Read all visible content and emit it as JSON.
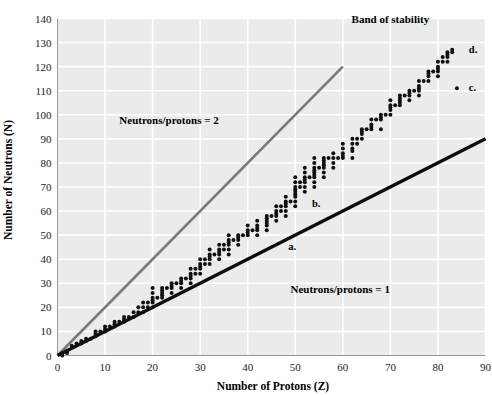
{
  "chart_data": {
    "type": "scatter",
    "title": "",
    "xlabel": "Number of Protons (Z)",
    "ylabel": "Number of Neutrons (N)",
    "xlim": [
      0,
      90
    ],
    "ylim": [
      0,
      140
    ],
    "xticks": [
      0,
      10,
      20,
      30,
      40,
      50,
      60,
      70,
      80,
      90
    ],
    "yticks": [
      0,
      10,
      20,
      30,
      40,
      50,
      60,
      70,
      80,
      90,
      100,
      110,
      120,
      130,
      140
    ],
    "xtick_labels": [
      "0",
      "10",
      "20",
      "30",
      "40",
      "50",
      "60",
      "70",
      "80",
      "90"
    ],
    "ytick_labels": [
      "0",
      "10",
      "20",
      "30",
      "40",
      "50",
      "60",
      "70",
      "80",
      "90",
      "100",
      "110",
      "120",
      "130",
      "140"
    ],
    "grid": true,
    "grid_color": "#ffffff",
    "plot_background": "#ebebeb",
    "legend": "none",
    "series": [
      {
        "name": "Stable nuclides",
        "type": "scatter",
        "marker": "circle",
        "color": "#111111",
        "points": [
          [
            1,
            0
          ],
          [
            1,
            1
          ],
          [
            2,
            1
          ],
          [
            2,
            2
          ],
          [
            3,
            4
          ],
          [
            4,
            5
          ],
          [
            5,
            5
          ],
          [
            5,
            6
          ],
          [
            6,
            6
          ],
          [
            6,
            7
          ],
          [
            7,
            7
          ],
          [
            8,
            8
          ],
          [
            8,
            9
          ],
          [
            8,
            10
          ],
          [
            9,
            10
          ],
          [
            10,
            10
          ],
          [
            10,
            11
          ],
          [
            10,
            12
          ],
          [
            11,
            12
          ],
          [
            12,
            12
          ],
          [
            12,
            13
          ],
          [
            12,
            14
          ],
          [
            13,
            14
          ],
          [
            14,
            14
          ],
          [
            14,
            15
          ],
          [
            14,
            16
          ],
          [
            15,
            16
          ],
          [
            16,
            16
          ],
          [
            16,
            18
          ],
          [
            17,
            18
          ],
          [
            17,
            20
          ],
          [
            18,
            18
          ],
          [
            18,
            20
          ],
          [
            18,
            22
          ],
          [
            19,
            20
          ],
          [
            19,
            22
          ],
          [
            20,
            20
          ],
          [
            20,
            22
          ],
          [
            20,
            23
          ],
          [
            20,
            24
          ],
          [
            20,
            26
          ],
          [
            20,
            28
          ],
          [
            21,
            24
          ],
          [
            22,
            24
          ],
          [
            22,
            25
          ],
          [
            22,
            26
          ],
          [
            22,
            27
          ],
          [
            22,
            28
          ],
          [
            23,
            28
          ],
          [
            24,
            26
          ],
          [
            24,
            28
          ],
          [
            24,
            29
          ],
          [
            24,
            30
          ],
          [
            25,
            30
          ],
          [
            26,
            28
          ],
          [
            26,
            30
          ],
          [
            26,
            31
          ],
          [
            26,
            32
          ],
          [
            27,
            32
          ],
          [
            28,
            30
          ],
          [
            28,
            32
          ],
          [
            28,
            33
          ],
          [
            28,
            34
          ],
          [
            28,
            36
          ],
          [
            29,
            34
          ],
          [
            29,
            36
          ],
          [
            30,
            34
          ],
          [
            30,
            36
          ],
          [
            30,
            37
          ],
          [
            30,
            38
          ],
          [
            30,
            40
          ],
          [
            31,
            38
          ],
          [
            31,
            40
          ],
          [
            32,
            38
          ],
          [
            32,
            40
          ],
          [
            32,
            41
          ],
          [
            32,
            42
          ],
          [
            32,
            44
          ],
          [
            33,
            42
          ],
          [
            34,
            40
          ],
          [
            34,
            42
          ],
          [
            34,
            43
          ],
          [
            34,
            44
          ],
          [
            34,
            46
          ],
          [
            35,
            44
          ],
          [
            35,
            46
          ],
          [
            36,
            42
          ],
          [
            36,
            44
          ],
          [
            36,
            46
          ],
          [
            36,
            47
          ],
          [
            36,
            48
          ],
          [
            36,
            50
          ],
          [
            37,
            48
          ],
          [
            38,
            46
          ],
          [
            38,
            48
          ],
          [
            38,
            49
          ],
          [
            38,
            50
          ],
          [
            39,
            50
          ],
          [
            40,
            50
          ],
          [
            40,
            51
          ],
          [
            40,
            52
          ],
          [
            40,
            54
          ],
          [
            41,
            52
          ],
          [
            42,
            50
          ],
          [
            42,
            52
          ],
          [
            42,
            53
          ],
          [
            42,
            54
          ],
          [
            42,
            56
          ],
          [
            44,
            52
          ],
          [
            44,
            54
          ],
          [
            44,
            55
          ],
          [
            44,
            56
          ],
          [
            44,
            57
          ],
          [
            44,
            58
          ],
          [
            45,
            58
          ],
          [
            46,
            56
          ],
          [
            46,
            58
          ],
          [
            46,
            59
          ],
          [
            46,
            60
          ],
          [
            46,
            62
          ],
          [
            47,
            60
          ],
          [
            47,
            62
          ],
          [
            48,
            58
          ],
          [
            48,
            60
          ],
          [
            48,
            62
          ],
          [
            48,
            63
          ],
          [
            48,
            64
          ],
          [
            48,
            66
          ],
          [
            49,
            64
          ],
          [
            50,
            62
          ],
          [
            50,
            64
          ],
          [
            50,
            66
          ],
          [
            50,
            67
          ],
          [
            50,
            68
          ],
          [
            50,
            69
          ],
          [
            50,
            70
          ],
          [
            50,
            72
          ],
          [
            50,
            74
          ],
          [
            51,
            70
          ],
          [
            51,
            72
          ],
          [
            52,
            68
          ],
          [
            52,
            70
          ],
          [
            52,
            72
          ],
          [
            52,
            73
          ],
          [
            52,
            74
          ],
          [
            52,
            76
          ],
          [
            52,
            78
          ],
          [
            53,
            74
          ],
          [
            54,
            70
          ],
          [
            54,
            72
          ],
          [
            54,
            74
          ],
          [
            54,
            75
          ],
          [
            54,
            76
          ],
          [
            54,
            77
          ],
          [
            54,
            78
          ],
          [
            54,
            80
          ],
          [
            54,
            82
          ],
          [
            55,
            78
          ],
          [
            56,
            74
          ],
          [
            56,
            76
          ],
          [
            56,
            78
          ],
          [
            56,
            79
          ],
          [
            56,
            80
          ],
          [
            56,
            81
          ],
          [
            56,
            82
          ],
          [
            57,
            82
          ],
          [
            58,
            78
          ],
          [
            58,
            80
          ],
          [
            58,
            82
          ],
          [
            58,
            84
          ],
          [
            59,
            82
          ],
          [
            60,
            82
          ],
          [
            60,
            83
          ],
          [
            60,
            84
          ],
          [
            60,
            86
          ],
          [
            60,
            88
          ],
          [
            62,
            82
          ],
          [
            62,
            85
          ],
          [
            62,
            86
          ],
          [
            62,
            88
          ],
          [
            62,
            90
          ],
          [
            63,
            88
          ],
          [
            63,
            90
          ],
          [
            64,
            90
          ],
          [
            64,
            92
          ],
          [
            64,
            93
          ],
          [
            64,
            94
          ],
          [
            65,
            94
          ],
          [
            66,
            94
          ],
          [
            66,
            95
          ],
          [
            66,
            96
          ],
          [
            66,
            98
          ],
          [
            67,
            98
          ],
          [
            68,
            94
          ],
          [
            68,
            98
          ],
          [
            68,
            99
          ],
          [
            68,
            100
          ],
          [
            69,
            100
          ],
          [
            70,
            100
          ],
          [
            70,
            102
          ],
          [
            70,
            103
          ],
          [
            70,
            104
          ],
          [
            70,
            106
          ],
          [
            71,
            104
          ],
          [
            72,
            104
          ],
          [
            72,
            105
          ],
          [
            72,
            106
          ],
          [
            72,
            107
          ],
          [
            72,
            108
          ],
          [
            73,
            108
          ],
          [
            74,
            106
          ],
          [
            74,
            108
          ],
          [
            74,
            109
          ],
          [
            74,
            110
          ],
          [
            75,
            110
          ],
          [
            76,
            108
          ],
          [
            76,
            110
          ],
          [
            76,
            111
          ],
          [
            76,
            112
          ],
          [
            76,
            114
          ],
          [
            77,
            114
          ],
          [
            78,
            114
          ],
          [
            78,
            116
          ],
          [
            78,
            117
          ],
          [
            78,
            118
          ],
          [
            79,
            118
          ],
          [
            80,
            116
          ],
          [
            80,
            118
          ],
          [
            80,
            119
          ],
          [
            80,
            120
          ],
          [
            80,
            122
          ],
          [
            81,
            122
          ],
          [
            81,
            124
          ],
          [
            82,
            122
          ],
          [
            82,
            124
          ],
          [
            82,
            125
          ],
          [
            82,
            126
          ],
          [
            83,
            126
          ],
          [
            83,
            127
          ],
          [
            84,
            111
          ]
        ]
      }
    ],
    "reference_lines": [
      {
        "name": "Neutrons/protons = 2",
        "label": "Neutrons/protons = 2",
        "color": "#7a7a7a",
        "width": 2.6,
        "from": [
          0,
          0
        ],
        "to": [
          60,
          120
        ],
        "slope": 2,
        "label_x": 13,
        "label_y": 96
      },
      {
        "name": "Neutrons/protons = 1",
        "label": "Neutrons/protons = 1",
        "color": "#0d0d0d",
        "width": 3.4,
        "from": [
          0,
          0
        ],
        "to": [
          90,
          90
        ],
        "slope": 1,
        "label_x": 49,
        "label_y": 26
      }
    ],
    "annotations": [
      {
        "name": "band-of-stability",
        "text": "Band of stability",
        "x": 70,
        "y": 138
      },
      {
        "name": "point-label-a",
        "text": "a.",
        "x": 48.5,
        "y": 44
      },
      {
        "name": "point-label-b",
        "text": "b.",
        "x": 53.5,
        "y": 61.5
      },
      {
        "name": "point-label-c",
        "text": "c.",
        "x": 86.5,
        "y": 110
      },
      {
        "name": "point-label-d",
        "text": "d.",
        "x": 86.5,
        "y": 125.5
      }
    ]
  }
}
